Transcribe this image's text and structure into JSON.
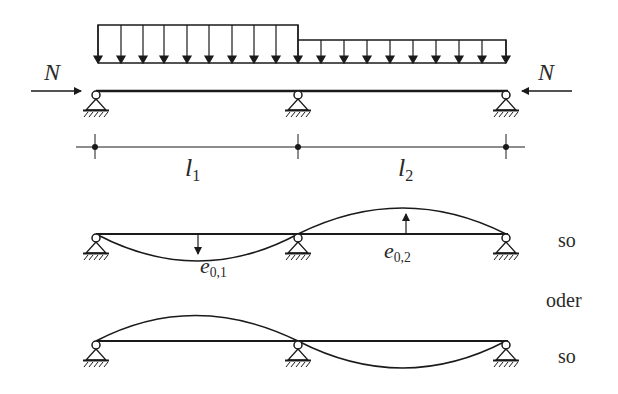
{
  "diagram": {
    "type": "continuous-beam-imperfection",
    "top": {
      "axial_force_left": "N",
      "axial_force_right": "N",
      "span_labels": [
        {
          "symbol": "l",
          "index": "1"
        },
        {
          "symbol": "l",
          "index": "2"
        }
      ],
      "loads": [
        {
          "span": 1,
          "type": "uniform",
          "intensity": "higher"
        },
        {
          "span": 2,
          "type": "uniform",
          "intensity": "lower"
        }
      ],
      "supports": 3
    },
    "variant_1": {
      "imperfection_labels": [
        {
          "symbol": "e",
          "index": "0,1"
        },
        {
          "symbol": "e",
          "index": "0,2"
        }
      ],
      "caption": "so"
    },
    "separator": "oder",
    "variant_2": {
      "caption": "so"
    }
  },
  "colors": {
    "line": "#1a1a1a",
    "text": "#2a2a2a",
    "background": "#ffffff"
  }
}
